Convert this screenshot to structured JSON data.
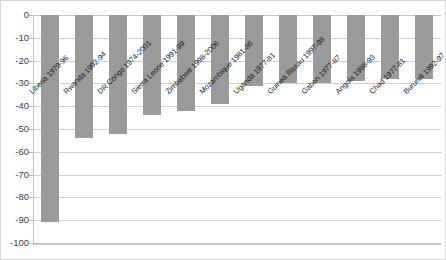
{
  "chart_data": {
    "type": "bar",
    "title": "",
    "subtitle": "",
    "xlabel": "",
    "ylabel": "",
    "ylim": [
      -100,
      0
    ],
    "ytick_step": 10,
    "yticks": [
      "0",
      "-10",
      "-20",
      "-30",
      "-40",
      "-50",
      "-60",
      "-70",
      "-80",
      "-90",
      "-100"
    ],
    "ytick_values": [
      0,
      -10,
      -20,
      -30,
      -40,
      -50,
      -60,
      -70,
      -80,
      -90,
      -100
    ],
    "grid": true,
    "legend": "none",
    "bar_color": "#9a9a9a",
    "gridline_color": "#d0d0d0",
    "categories": [
      "Liberia 1979-96",
      "Rwanda 1992-94",
      "DR Congo 1974-2001",
      "Sierra Leone 1991-99",
      "Zimbabwe 1998-2006",
      "Mozambique 1981-86",
      "Uganda 1977-81",
      "Guinea Bissau 1997-98",
      "Gabon 1977-87",
      "Angola 1988-93",
      "Chad 1977-81",
      "Burundi 1992-97"
    ],
    "values": [
      -91,
      -54,
      -52,
      -44,
      -42,
      -39,
      -31,
      -30,
      -30,
      -29,
      -28,
      -28
    ]
  }
}
